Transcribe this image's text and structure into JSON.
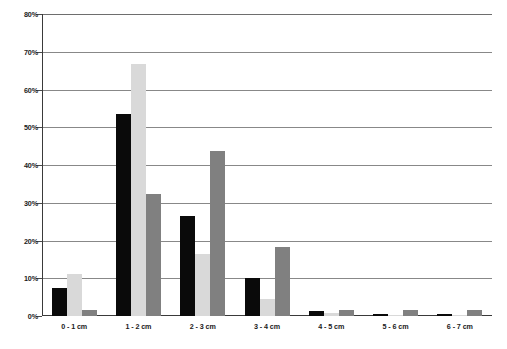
{
  "chart_data": {
    "type": "bar",
    "title": "",
    "subtitle": "",
    "xlabel": "",
    "ylabel": "",
    "categories": [
      "0 - 1 cm",
      "1 - 2 cm",
      "2 - 3 cm",
      "3 - 4 cm",
      "4 - 5 cm",
      "5 - 6 cm",
      "6 - 7 cm"
    ],
    "series": [
      {
        "name": "series-1",
        "color": "#0a0a0a",
        "values": [
          7.5,
          53.5,
          26.5,
          10.0,
          1.3,
          0.6,
          0.6
        ]
      },
      {
        "name": "series-2",
        "color": "#d9d9d9",
        "values": [
          11.0,
          66.7,
          16.5,
          4.5,
          0.8,
          0.2,
          0.2
        ]
      },
      {
        "name": "series-3",
        "color": "#808080",
        "values": [
          1.5,
          32.3,
          43.8,
          18.3,
          1.6,
          1.5,
          1.6
        ]
      }
    ],
    "ylim": [
      0,
      80
    ],
    "ytick_step": 10,
    "ytick_labels": [
      "0%",
      "10%",
      "20%",
      "30%",
      "40%",
      "50%",
      "60%",
      "70%",
      "80%"
    ],
    "grid": true,
    "grid_axis": "y",
    "legend": "none",
    "legend_position": "none",
    "annotations": []
  }
}
